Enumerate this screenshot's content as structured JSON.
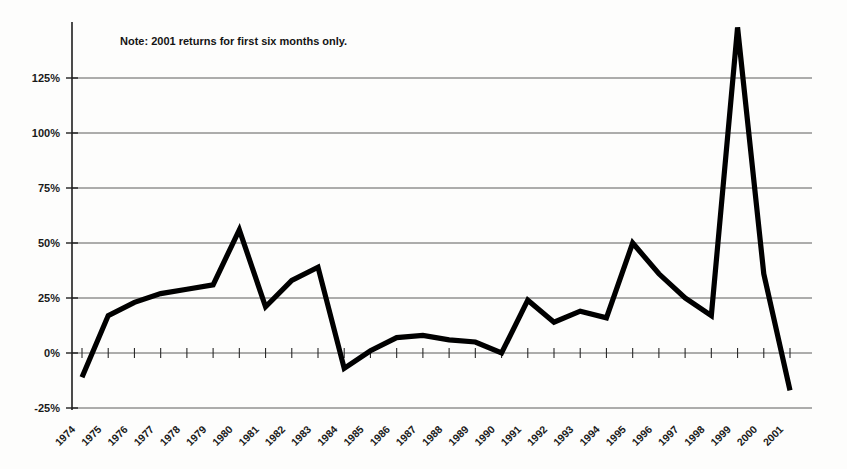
{
  "note": {
    "text": "Note: 2001 returns for first six months only."
  },
  "axes": {
    "y_ticks": [
      "-25%",
      "0%",
      "25%",
      "50%",
      "75%",
      "100%",
      "125%"
    ],
    "y_tick_values": [
      -25,
      0,
      25,
      50,
      75,
      100,
      125
    ]
  },
  "chart_data": {
    "type": "line",
    "title": "",
    "subtitle": "",
    "xlabel": "",
    "ylabel": "",
    "annotation": "Note: 2001 returns for first six months only.",
    "grid": true,
    "legend": "none",
    "ylim": [
      -25,
      150
    ],
    "ytick_labels": [
      "-25%",
      "0%",
      "25%",
      "50%",
      "75%",
      "100%",
      "125%"
    ],
    "ytick_values": [
      -25,
      0,
      25,
      50,
      75,
      100,
      125
    ],
    "categories": [
      "1974",
      "1975",
      "1976",
      "1977",
      "1978",
      "1979",
      "1980",
      "1981",
      "1982",
      "1983",
      "1984",
      "1985",
      "1986",
      "1987",
      "1988",
      "1989",
      "1990",
      "1991",
      "1992",
      "1993",
      "1994",
      "1995",
      "1996",
      "1997",
      "1998",
      "1999",
      "2000",
      "2001"
    ],
    "values": [
      -11,
      17,
      23,
      27,
      29,
      31,
      56,
      21,
      33,
      39,
      -7,
      1,
      7,
      8,
      6,
      5,
      0,
      24,
      14,
      19,
      16,
      50,
      36,
      25,
      17,
      148,
      36,
      -17
    ],
    "series": [
      {
        "name": "Annual return",
        "color": "#000000",
        "values": [
          -11,
          17,
          23,
          27,
          29,
          31,
          56,
          21,
          33,
          39,
          -7,
          1,
          7,
          8,
          6,
          5,
          0,
          24,
          14,
          19,
          16,
          50,
          36,
          25,
          17,
          148,
          36,
          -17
        ]
      }
    ]
  },
  "colors": {
    "line": "#000000",
    "grid": "#4a4a4a",
    "axis": "#1f1f1f",
    "background": "#fdfdfc",
    "text": "#1a1a1a"
  }
}
